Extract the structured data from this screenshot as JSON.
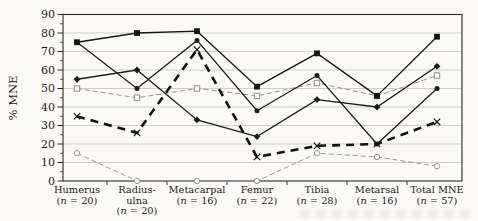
{
  "figure": {
    "background": "#fbfaf6",
    "frame_color": "#2a2a29",
    "grid_color": "#bcbbb6"
  },
  "chart_data": {
    "type": "line",
    "title": "",
    "xlabel": "",
    "ylabel": "% MNE",
    "ylim": [
      0,
      90
    ],
    "yticks": [
      0,
      10,
      20,
      30,
      40,
      50,
      60,
      70,
      80,
      90
    ],
    "grid": "horizontal",
    "legend": "none",
    "categories": [
      "Humerus",
      "Radius-ulna",
      "Metacarpal",
      "Femur",
      "Tibia",
      "Metarsal",
      "Total MNE"
    ],
    "category_label_lines": [
      [
        "Humerus"
      ],
      [
        "Radius-",
        "ulna"
      ],
      [
        "Metacarpal"
      ],
      [
        "Femur"
      ],
      [
        "Tibia"
      ],
      [
        "Metarsal"
      ],
      [
        "Total MNE"
      ]
    ],
    "category_sublabels": [
      "(n = 20)",
      "(n = 20)",
      "(n = 16)",
      "(n = 22)",
      "(n = 28)",
      "(n = 16)",
      "(n = 57)"
    ],
    "series": [
      {
        "name": "open-circle-dashed",
        "marker": "open-circle",
        "line": "dashed-thin",
        "color": "#9a9994",
        "values": [
          15,
          0,
          0,
          0,
          15,
          13,
          8
        ]
      },
      {
        "name": "open-square-dashed",
        "marker": "open-square",
        "line": "dashed-thin",
        "color": "#94938e",
        "values": [
          50,
          45,
          50,
          46,
          53,
          46,
          57
        ]
      },
      {
        "name": "filled-diamond-solid",
        "marker": "filled-diamond",
        "line": "solid",
        "color": "#1b1b1a",
        "values": [
          55,
          60,
          33,
          24,
          44,
          40,
          62
        ]
      },
      {
        "name": "filled-circle-solid",
        "marker": "filled-circle",
        "line": "solid",
        "color": "#1b1b1a",
        "values": [
          75,
          50,
          76,
          38,
          57,
          20,
          50
        ]
      },
      {
        "name": "filled-square-solid",
        "marker": "filled-square",
        "line": "solid",
        "color": "#161615",
        "values": [
          75,
          80,
          81,
          51,
          69,
          46,
          78
        ]
      },
      {
        "name": "x-thick-dashed",
        "marker": "x",
        "line": "dashed-thick",
        "color": "#111110",
        "values": [
          35,
          26,
          71,
          13,
          19,
          20,
          32
        ]
      }
    ]
  }
}
